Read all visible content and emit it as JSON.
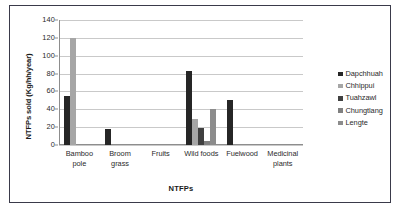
{
  "chart_data": {
    "type": "bar",
    "title": "",
    "subtitle": "",
    "xlabel": "NTFPs",
    "ylabel": "NTFPs sold (Kg/hh/year)",
    "ylim": [
      0,
      140
    ],
    "ytick_step": 20,
    "yticks": [
      "0",
      "20",
      "40",
      "60",
      "80",
      "100",
      "120",
      "140"
    ],
    "grid": true,
    "legend_position": "right",
    "categories": [
      "Bamboo pole",
      "Broom grass",
      "Fruits",
      "Wild foods",
      "Fuelwood",
      "Medicinal plants"
    ],
    "series": [
      {
        "name": "Dapchhuah",
        "color": "#262626",
        "values": [
          55,
          18,
          0,
          83,
          50,
          0
        ]
      },
      {
        "name": "Chhippui",
        "color": "#a6a6a6",
        "values": [
          120,
          0,
          0,
          29,
          0,
          0
        ]
      },
      {
        "name": "Tuahzawl",
        "color": "#404040",
        "values": [
          0,
          0,
          0,
          19,
          0,
          0
        ]
      },
      {
        "name": "Chungtlang",
        "color": "#808080",
        "values": [
          0,
          0,
          0,
          4,
          0,
          0
        ]
      },
      {
        "name": "Lengte",
        "color": "#8c8c8c",
        "values": [
          0,
          0,
          0,
          40,
          0,
          0
        ]
      }
    ]
  }
}
